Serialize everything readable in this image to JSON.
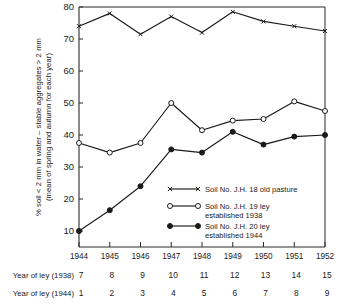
{
  "chart_data": {
    "type": "line",
    "title": "",
    "xlabel": "",
    "ylabel": "% soil < 2 mm in water – stable aggregates > 2 mm (mean of spring and autumn for each year)",
    "ylabel_line1": "% soil < 2 mm in water – stable aggregates > 2 mm",
    "ylabel_line2": "(mean of spring and autumn for each year)",
    "x": [
      "1944",
      "1945",
      "1946",
      "1947",
      "1948",
      "1949",
      "1950",
      "1951",
      "1952"
    ],
    "categories": [
      "1944",
      "1945",
      "1946",
      "1947",
      "1948",
      "1949",
      "1950",
      "1951",
      "1952"
    ],
    "ylim": [
      5,
      80
    ],
    "yticks": [
      10,
      20,
      30,
      40,
      50,
      60,
      70,
      80
    ],
    "ytick_labels": [
      "10",
      "20",
      "30",
      "40",
      "50",
      "60",
      "70",
      "80"
    ],
    "grid": false,
    "legend_position": "center-right-inside",
    "series": [
      {
        "name": "Soil No. J.H. 18 old pasture",
        "marker": "cross",
        "values": [
          74,
          78,
          71.5,
          77,
          72,
          78.5,
          75.5,
          74,
          72.5
        ]
      },
      {
        "name": "Soil No. J.H. 19 ley established 1938",
        "marker": "open-circle",
        "values": [
          37.5,
          34.5,
          37.5,
          50,
          41.5,
          44.5,
          45,
          50.5,
          47.5
        ]
      },
      {
        "name": "Soil No. J.H. 20 ley established 1944",
        "marker": "filled-circle",
        "values": [
          10,
          16.5,
          24,
          35.5,
          34.5,
          41,
          37,
          39.5,
          40
        ]
      }
    ]
  },
  "legend": {
    "entries": [
      {
        "marker": "cross",
        "line1": "Soil No. J.H. 18 old pasture",
        "line2": ""
      },
      {
        "marker": "open-circle",
        "line1": "Soil No. J.H. 19 ley",
        "line2": "established 1938"
      },
      {
        "marker": "filled-circle",
        "line1": "Soil No. J.H. 20 ley",
        "line2": "established 1944"
      }
    ]
  },
  "bottom_rows": [
    {
      "label": "Year of ley (1938)",
      "values": [
        "7",
        "8",
        "9",
        "10",
        "11",
        "12",
        "13",
        "14",
        "15"
      ]
    },
    {
      "label": "Year of ley (1944)",
      "values": [
        "1",
        "2",
        "3",
        "4",
        "5",
        "6",
        "7",
        "8",
        "9"
      ]
    }
  ],
  "colors": {
    "ink": "#1a1a1a",
    "axis": "#2b2b2b",
    "background": "#ffffff"
  }
}
